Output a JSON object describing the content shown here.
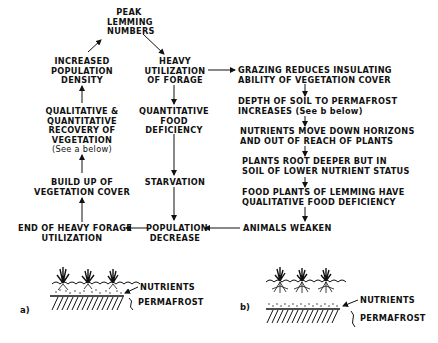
{
  "diagram": {
    "nodes": {
      "peak": [
        "PEAK",
        "LEMMING",
        "NUMBERS"
      ],
      "heavy_util": [
        "HEAVY",
        "UTILIZATION",
        "OF FORAGE"
      ],
      "increased_density": [
        "INCREASED",
        "POPULATION",
        "DENSITY"
      ],
      "quant_deficiency": [
        "QUANTITATIVE",
        "FOOD",
        "DEFICIENCY"
      ],
      "recovery": [
        "QUALITATIVE &",
        "QUANTITATIVE",
        "RECOVERY OF",
        "VEGETATION",
        "(See a below)"
      ],
      "starvation": [
        "STARVATION"
      ],
      "buildup": [
        "BUILD UP OF",
        "VEGETATION COVER"
      ],
      "end_forage": [
        "END OF HEAVY FORAGE",
        "UTILIZATION"
      ],
      "pop_decrease": [
        "POPULATION",
        "DECREASE"
      ],
      "grazing": [
        "GRAZING REDUCES INSULATING",
        "ABILITY OF VEGETATION COVER"
      ],
      "depth": [
        "DEPTH OF SOIL TO PERMAFROST",
        "INCREASES (See b below)"
      ],
      "nutrients_move": [
        "NUTRIENTS MOVE DOWN HORIZONS",
        "AND OUT OF REACH OF PLANTS"
      ],
      "root_deeper": [
        "PLANTS ROOT DEEPER BUT IN",
        "SOIL OF LOWER NUTRIENT STATUS"
      ],
      "food_plants": [
        "FOOD PLANTS OF LEMMING HAVE",
        "QUALITATIVE FOOD DEFICIENCY"
      ],
      "weaken": [
        "ANIMALS WEAKEN"
      ]
    },
    "panel_a": {
      "label": "a)",
      "nutrients": "NUTRIENTS",
      "permafrost": "PERMAFROST"
    },
    "panel_b": {
      "label": "b)",
      "nutrients": "NUTRIENTS",
      "permafrost": "PERMAFROST"
    }
  }
}
